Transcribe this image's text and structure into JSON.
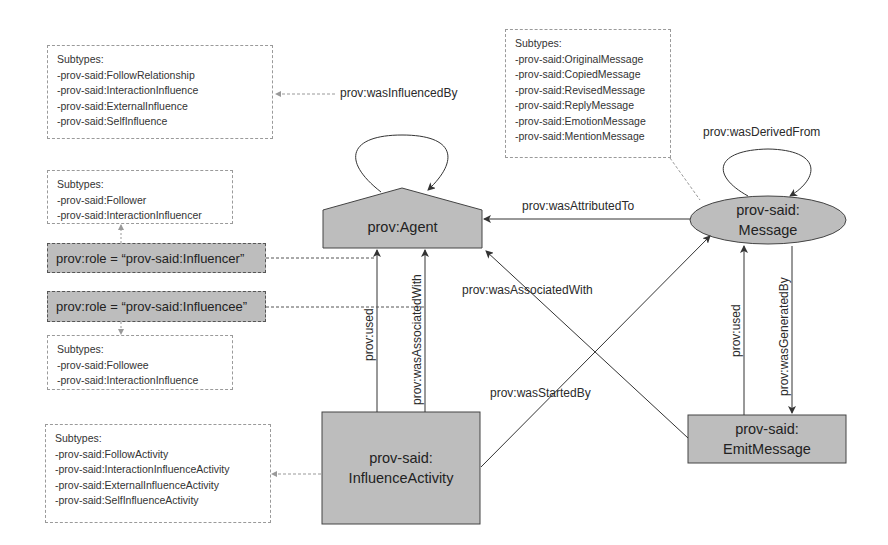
{
  "nodes": {
    "agent": {
      "label": "prov:Agent",
      "shape": "pentagon",
      "fill": "#bdbdbd"
    },
    "message": {
      "line1": "prov-said:",
      "line2": "Message",
      "shape": "ellipse",
      "fill": "#bdbdbd"
    },
    "influence_activity": {
      "line1": "prov-said:",
      "line2": "InfluenceActivity",
      "shape": "rectangle",
      "fill": "#bdbdbd"
    },
    "emit_message": {
      "line1": "prov-said:",
      "line2": "EmitMessage",
      "shape": "rectangle",
      "fill": "#bdbdbd"
    }
  },
  "roles": {
    "influencer": "prov:role = “prov-said:Influencer”",
    "influencee": "prov:role = “prov-said:Influencee”"
  },
  "notes": {
    "influence_subtypes": {
      "title": "Subtypes:",
      "items": [
        "-prov-said:FollowRelationship",
        "-prov-said:InteractionInfluence",
        "-prov-said:ExternalInfluence",
        "-prov-said:SelfInfluence"
      ]
    },
    "message_subtypes": {
      "title": "Subtypes:",
      "items": [
        "-prov-said:OriginalMessage",
        "-prov-said:CopiedMessage",
        "-prov-said:RevisedMessage",
        "-prov-said:ReplyMessage",
        "-prov-said:EmotionMessage",
        "-prov-said:MentionMessage"
      ]
    },
    "influencer_subtypes": {
      "title": "Subtypes:",
      "items": [
        "-prov-said:Follower",
        "-prov-said:InteractionInfluencer"
      ]
    },
    "influencee_subtypes": {
      "title": "Subtypes:",
      "items": [
        "-prov-said:Followee",
        "-prov-said:InteractionInfluence"
      ]
    },
    "activity_subtypes": {
      "title": "Subtypes:",
      "items": [
        "-prov-said:FollowActivity",
        "-prov-said:InteractionInfluenceActivity",
        "-prov-said:ExternalInfluenceActivity",
        "-prov-said:SelfInfluenceActivity"
      ]
    }
  },
  "edges": {
    "was_influenced_by": "prov:wasInfluencedBy",
    "was_derived_from": "prov:wasDerivedFrom",
    "was_attributed_to": "prov:wasAttributedTo",
    "was_associated_with_diag": "prov:wasAssociatedWith",
    "was_started_by": "prov:wasStartedBy",
    "activity_used": "prov:used",
    "activity_was_associated_with": "prov:wasAssociatedWith",
    "emit_used": "prov:used",
    "was_generated_by": "prov:wasGeneratedBy"
  }
}
